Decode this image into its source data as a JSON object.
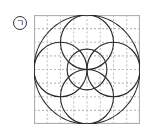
{
  "label": {
    "text": "ㄱ"
  },
  "figure": {
    "grid": {
      "cols": 8,
      "rows": 8,
      "cell_px": 13.25,
      "border_color": "#b0b0b0",
      "line_color": "#bdbdbd"
    },
    "stroke_color": "#2a2a2a",
    "circles": [
      {
        "name": "outer-circle",
        "cx": 4,
        "cy": 4,
        "r": 4
      },
      {
        "name": "top-circle",
        "cx": 4,
        "cy": 2,
        "r": 2
      },
      {
        "name": "bottom-circle",
        "cx": 4,
        "cy": 6,
        "r": 2
      },
      {
        "name": "left-circle",
        "cx": 2,
        "cy": 4,
        "r": 2
      },
      {
        "name": "right-circle",
        "cx": 6,
        "cy": 4,
        "r": 2
      },
      {
        "name": "center-circle",
        "cx": 4,
        "cy": 4,
        "r": 1.5
      }
    ]
  }
}
